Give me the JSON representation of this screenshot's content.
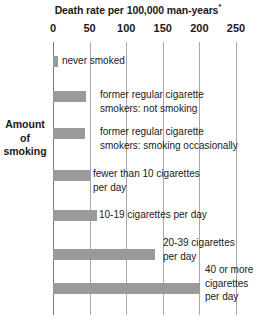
{
  "chart_data": {
    "type": "bar",
    "orientation": "horizontal",
    "title": "Death rate per 100,000 man-years",
    "title_footnote_marker": "*",
    "xlabel": "Death rate per 100,000 man-years",
    "ylabel": "Amount of smoking",
    "xlim": [
      0,
      250
    ],
    "xticks": [
      0,
      50,
      100,
      150,
      200,
      250
    ],
    "xtick_labels": [
      "0",
      "50",
      "100",
      "150",
      "200",
      "250"
    ],
    "grid": true,
    "legend": "none",
    "bar_color": "#9a9a9a",
    "gridline_color": "#a8a8a8",
    "categories": [
      "never smoked",
      "former regular cigarette smokers: not smoking",
      "former regular cigarette smokers: smoking occasionally",
      "fewer than 10 cigarettes per day",
      "10-19 cigarettes per day",
      "20-39 cigarettes per day",
      "40 or more cigarettes per day"
    ],
    "values": [
      7,
      45,
      44,
      51,
      60,
      139,
      201
    ]
  },
  "axis": {
    "y_title": "Amount\nof\nsmoking"
  },
  "bars": [
    {
      "label": "never smoked",
      "value": 7
    },
    {
      "label": "former regular cigarette\nsmokers: not smoking",
      "value": 45
    },
    {
      "label": "former regular cigarette\nsmokers: smoking occasionally",
      "value": 44
    },
    {
      "label": "fewer than 10 cigarettes\nper day",
      "value": 51
    },
    {
      "label": "10-19 cigarettes per day",
      "value": 60
    },
    {
      "label": "20-39 cigarettes\nper day",
      "value": 139
    },
    {
      "label": "40 or more\ncigarettes\nper day",
      "value": 201
    }
  ]
}
